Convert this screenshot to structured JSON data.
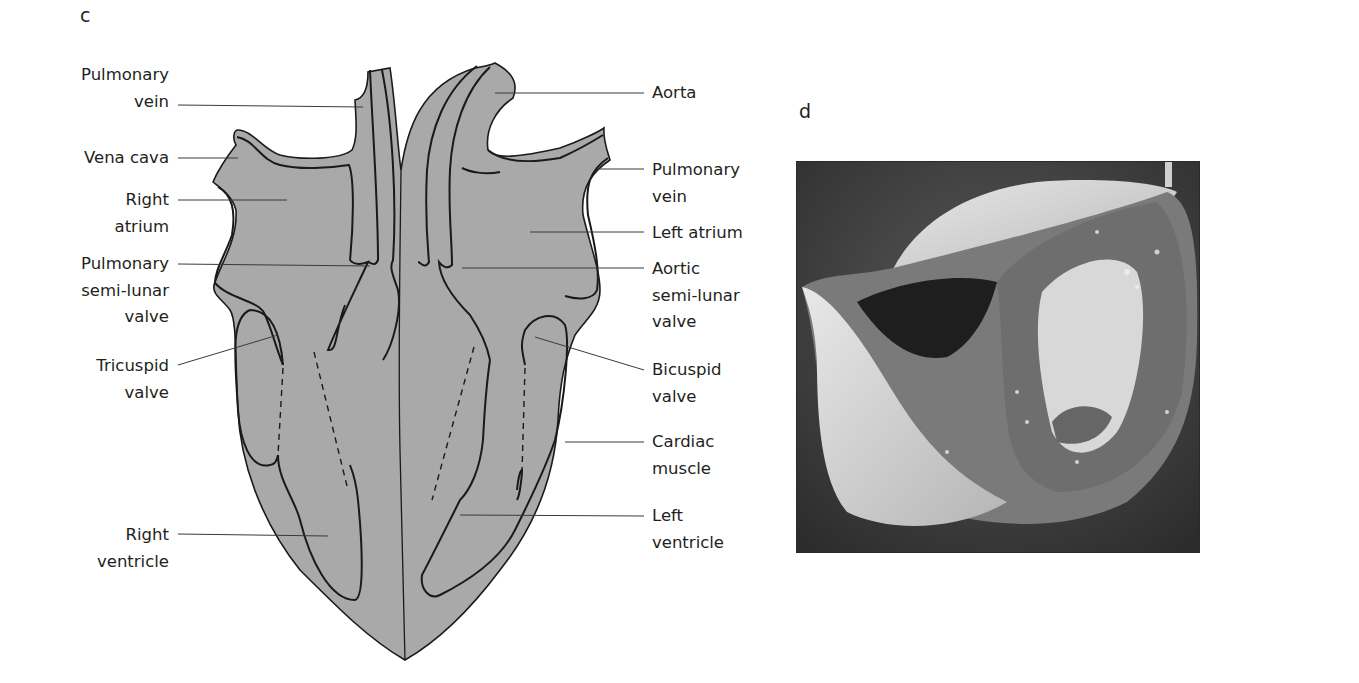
{
  "figure": {
    "panel_c": {
      "letter": "c",
      "title": "Heart structure diagram",
      "fill_color": "#a9a9a9",
      "outline_color": "#1a1a1a",
      "left_labels": [
        {
          "id": "pulmonary-vein-left",
          "text": "Pulmonary\nvein"
        },
        {
          "id": "vena-cava",
          "text": "Vena cava"
        },
        {
          "id": "right-atrium",
          "text": "Right\natrium"
        },
        {
          "id": "pulmonary-semi-lunar-valve",
          "text": "Pulmonary\nsemi-lunar\nvalve"
        },
        {
          "id": "tricuspid-valve",
          "text": "Tricuspid\nvalve"
        },
        {
          "id": "right-ventricle",
          "text": "Right\nventricle"
        }
      ],
      "right_labels": [
        {
          "id": "aorta",
          "text": "Aorta"
        },
        {
          "id": "pulmonary-vein-right",
          "text": "Pulmonary\nvein"
        },
        {
          "id": "left-atrium",
          "text": "Left atrium"
        },
        {
          "id": "aortic-semi-lunar-valve",
          "text": "Aortic\nsemi-lunar\nvalve"
        },
        {
          "id": "bicuspid-valve",
          "text": "Bicuspid\nvalve"
        },
        {
          "id": "cardiac-muscle",
          "text": "Cardiac\nmuscle"
        },
        {
          "id": "left-ventricle",
          "text": "Left\nventricle"
        }
      ]
    },
    "panel_d": {
      "letter": "d",
      "description": "Photograph of a dissected heart in cross-section (grayscale)",
      "background_color": "#3c3c3c"
    }
  }
}
